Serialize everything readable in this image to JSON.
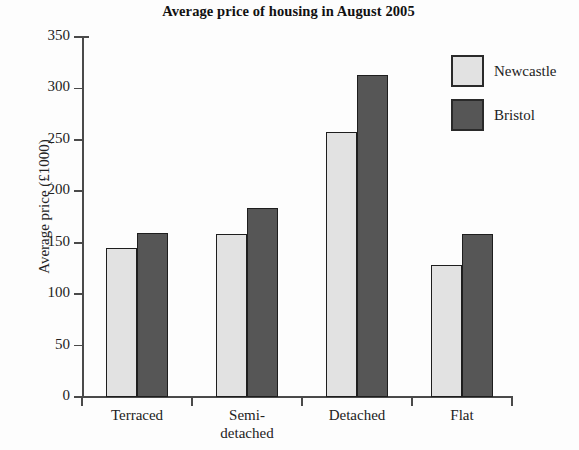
{
  "chart_data": {
    "type": "bar",
    "title": "Average price of housing in August 2005",
    "xlabel": "",
    "ylabel": "Average price (£1000)",
    "categories": [
      "Terraced",
      "Semi-\ndetached",
      "Detached",
      "Flat"
    ],
    "series": [
      {
        "name": "Newcastle",
        "color": "#e2e2e2",
        "values": [
          145,
          158,
          258,
          128
        ]
      },
      {
        "name": "Bristol",
        "color": "#565656",
        "values": [
          159,
          184,
          313,
          158
        ]
      }
    ],
    "ylim": [
      0,
      350
    ],
    "yticks": [
      0,
      50,
      100,
      150,
      200,
      250,
      300,
      350
    ],
    "ytick_labels": [
      "0",
      "50",
      "100",
      "150",
      "200",
      "250",
      "300",
      "350"
    ],
    "grid": false,
    "legend_position": "top-right"
  },
  "axis": {
    "y_title": "Average price (£1000)"
  },
  "legend": {
    "entries": [
      {
        "label": "Newcastle"
      },
      {
        "label": "Bristol"
      }
    ]
  }
}
